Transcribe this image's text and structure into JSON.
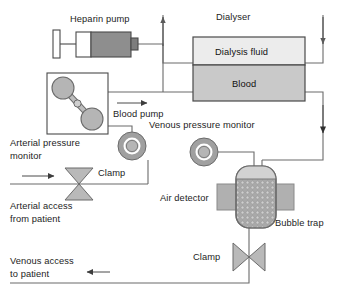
{
  "diagram": {
    "type": "flow-schematic",
    "canvas": {
      "width": 339,
      "height": 302
    },
    "labels": {
      "heparin_pump": "Heparin pump",
      "dialyser": "Dialyser",
      "dialysis_fluid": "Dialysis fluid",
      "blood": "Blood",
      "blood_pump": "Blood pump",
      "venous_pressure_monitor": "Venous pressure monitor",
      "arterial_pressure_monitor_line1": "Arterial pressure",
      "arterial_pressure_monitor_line2": "monitor",
      "clamp_arterial": "Clamp",
      "clamp_venous": "Clamp",
      "arterial_access_line1": "Arterial access",
      "arterial_access_line2": "from patient",
      "venous_access_line1": "Venous access",
      "venous_access_line2": "to patient",
      "air_detector": "Air detector",
      "bubble_trap": "Bubble trap"
    },
    "colors": {
      "background": "#ffffff",
      "tube_stroke": "#6b6b6b",
      "outline": "#4a4a4a",
      "text": "#1d1d1d",
      "dialysis_fluid_fill": "#ececec",
      "blood_fill": "#c9c9c9",
      "syringe_barrel_fill": "#8e8e8e",
      "syringe_empty_fill": "#ffffff",
      "pump_roller_fill": "#b5b5b5",
      "monitor_outer_fill": "#a0a0a0",
      "monitor_inner_fill": "#b8b8b8",
      "clamp_fill": "#b9b9b9",
      "bubble_trap_fill": "#a8a8a8",
      "bubble_trap_top_fill": "#d2d2d2",
      "air_detector_fill": "#b0b0b0"
    },
    "flow_arrows": [
      {
        "name": "dialysis-fluid-outflow",
        "direction": "up",
        "side": "left-of-dialyser"
      },
      {
        "name": "dialysis-fluid-inflow",
        "direction": "down",
        "side": "right-of-dialyser"
      },
      {
        "name": "blood-to-dialyser",
        "direction": "right",
        "side": "blood-pump-outlet"
      },
      {
        "name": "blood-from-dialyser",
        "direction": "down",
        "side": "right-return"
      },
      {
        "name": "arterial-inflow",
        "direction": "right",
        "side": "arterial-access"
      },
      {
        "name": "venous-outflow",
        "direction": "left",
        "side": "venous-access"
      }
    ],
    "components": [
      {
        "name": "heparin-pump",
        "shape": "syringe"
      },
      {
        "name": "blood-pump",
        "shape": "roller-pump-box"
      },
      {
        "name": "dialyser",
        "shape": "two-compartment-rect"
      },
      {
        "name": "arterial-pressure-monitor",
        "shape": "circle-gauge"
      },
      {
        "name": "venous-pressure-monitor",
        "shape": "circle-gauge"
      },
      {
        "name": "arterial-clamp",
        "shape": "bowtie-vertical"
      },
      {
        "name": "venous-clamp",
        "shape": "bowtie-horizontal"
      },
      {
        "name": "bubble-trap",
        "shape": "rounded-chamber-stippled"
      },
      {
        "name": "air-detector",
        "shape": "horizontal-bar"
      }
    ]
  }
}
